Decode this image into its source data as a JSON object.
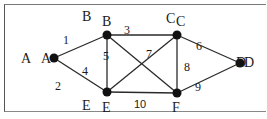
{
  "graph": {
    "nodes": [
      {
        "id": "A",
        "x": 54,
        "y": 58,
        "label": "A",
        "ghost_label": "A"
      },
      {
        "id": "B",
        "x": 107,
        "y": 35,
        "label": "B",
        "ghost_label": "B"
      },
      {
        "id": "C",
        "x": 177,
        "y": 35,
        "label": "C",
        "ghost_label": "C"
      },
      {
        "id": "D",
        "x": 240,
        "y": 63,
        "label": "D",
        "ghost_label": "D"
      },
      {
        "id": "E",
        "x": 107,
        "y": 92,
        "label": "E",
        "ghost_label": "E"
      },
      {
        "id": "F",
        "x": 177,
        "y": 93,
        "label": "F"
      }
    ],
    "edges": [
      {
        "from": "A",
        "to": "B",
        "weight": "1"
      },
      {
        "from": "A",
        "to": "E",
        "weight": "4"
      },
      {
        "from": "B",
        "to": "C",
        "weight": "3"
      },
      {
        "from": "B",
        "to": "E",
        "weight": "5"
      },
      {
        "from": "B",
        "to": "F",
        "weight": ""
      },
      {
        "from": "E",
        "to": "C",
        "weight": "7"
      },
      {
        "from": "C",
        "to": "F",
        "weight": "8"
      },
      {
        "from": "C",
        "to": "D",
        "weight": "6"
      },
      {
        "from": "D",
        "to": "F",
        "weight": "9"
      },
      {
        "from": "E",
        "to": "F",
        "weight": "10"
      }
    ],
    "extra_labels": {
      "two": "2"
    },
    "colors": {
      "edge": "#2a2a2a",
      "node": "#111111"
    }
  }
}
